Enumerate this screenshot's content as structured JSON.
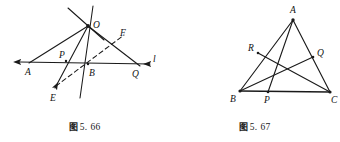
{
  "sheet": {
    "width": 340,
    "height": 142,
    "background": "#ffffff",
    "stroke_color": "#1a1a1a"
  },
  "figures": [
    {
      "id": "fig-5-66",
      "caption_zh": "图",
      "caption_number": "5. 66",
      "caption_full": "图 5. 66",
      "description": "Point O above line l with cevian-like rays meeting transversal l at A, B, Q; auxiliary dashed segment E-F",
      "points": {
        "O": {
          "label": "O",
          "x": 88,
          "y": 26,
          "label_dx": 5,
          "label_dy": 1
        },
        "A": {
          "label": "A",
          "x": 28,
          "y": 64,
          "label_dx": -1,
          "label_dy": 11
        },
        "P": {
          "label": "P",
          "x": 66,
          "y": 60,
          "label_dx": -5,
          "label_dy": -2
        },
        "B": {
          "label": "B",
          "x": 88,
          "y": 65,
          "label_dx": 2,
          "label_dy": 11
        },
        "Q": {
          "label": "Q",
          "x": 137,
          "y": 65,
          "label_dx": -2,
          "label_dy": 11
        },
        "E": {
          "label": "E",
          "x": 53,
          "y": 90,
          "label_dx": -2,
          "label_dy": 11
        },
        "F": {
          "label": "F",
          "x": 119,
          "y": 38,
          "label_dx": 3,
          "label_dy": -4
        },
        "l": {
          "label": "l",
          "x": 152,
          "y": 62,
          "label_dx": 2,
          "label_dy": 0
        }
      },
      "labels": [
        "O",
        "A",
        "P",
        "B",
        "Q",
        "E",
        "F",
        "l"
      ],
      "solid_lines": [
        {
          "name": "line-l",
          "from": "A-extended-left",
          "to": "l-arrow-right"
        },
        {
          "name": "ray-OA",
          "from": "O",
          "to": "A"
        },
        {
          "name": "ray-O-through-P-to-E",
          "from": "O",
          "to": "E"
        },
        {
          "name": "ray-OB-extended",
          "from": "O",
          "to": "B-below"
        },
        {
          "name": "ray-OQ-through-F",
          "from": "O",
          "to": "Q"
        },
        {
          "name": "cross-line-through-O",
          "from": "upper-left",
          "to": "lower-right"
        }
      ],
      "dashed_lines": [
        {
          "name": "segment-EF",
          "from": "E",
          "to": "F"
        }
      ],
      "arrowheads": [
        "line-l-left",
        "line-l-right",
        "ray-to-E"
      ]
    },
    {
      "id": "fig-5-67",
      "caption_zh": "图",
      "caption_number": "5. 67",
      "caption_full": "图 5. 67",
      "description": "Triangle ABC with cevians AP, BQ and CR meeting interior",
      "points": {
        "A": {
          "label": "A",
          "x": 123,
          "y": 18,
          "label_dx": 0,
          "label_dy": -4
        },
        "B": {
          "label": "B",
          "x": 70,
          "y": 91,
          "label_dx": -8,
          "label_dy": 10
        },
        "C": {
          "label": "C",
          "x": 160,
          "y": 92,
          "label_dx": 4,
          "label_dy": 10
        },
        "R": {
          "label": "R",
          "x": 88,
          "y": 53,
          "label_dx": -9,
          "label_dy": -1
        },
        "Q": {
          "label": "Q",
          "x": 143,
          "y": 56,
          "label_dx": 4,
          "label_dy": 0
        },
        "P": {
          "label": "P",
          "x": 98,
          "y": 92,
          "label_dx": -1,
          "label_dy": 11
        }
      },
      "labels": [
        "A",
        "B",
        "C",
        "R",
        "Q",
        "P"
      ],
      "solid_lines": [
        {
          "name": "side-AB",
          "from": "A",
          "to": "B"
        },
        {
          "name": "side-AC",
          "from": "A",
          "to": "C"
        },
        {
          "name": "side-BC",
          "from": "B",
          "to": "C"
        },
        {
          "name": "cevian-AP",
          "from": "A",
          "to": "P"
        },
        {
          "name": "cevian-BQ",
          "from": "B",
          "to": "Q"
        },
        {
          "name": "cevian-CR",
          "from": "C",
          "to": "R"
        }
      ],
      "dashed_lines": [],
      "arrowheads": []
    }
  ]
}
